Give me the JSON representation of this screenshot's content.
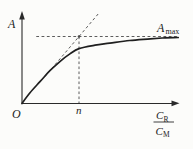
{
  "colors": {
    "background": "#fcfcfa",
    "ink": "#222222",
    "curve": "#1f1f1f",
    "dash": "#4a4a4a"
  },
  "labels": {
    "y_axis": "A",
    "origin": "O",
    "n_marker": "n",
    "amax_base": "A",
    "amax_sub": "max",
    "frac_num_base": "C",
    "frac_num_sub": "R",
    "frac_den_base": "C",
    "frac_den_sub": "M"
  },
  "chart_data": {
    "type": "line",
    "title": "",
    "xlabel": "C_R/C_M",
    "ylabel": "A",
    "x_units": "normalized, tangent-asymptote intersection at x = n = 1",
    "y_units": "normalized, asymptote A_max = 1",
    "xlim": [
      0,
      2.9
    ],
    "ylim": [
      0,
      1.45
    ],
    "grid": false,
    "series": [
      {
        "name": "absorbance saturation curve",
        "x": [
          0,
          0.14,
          0.32,
          0.49,
          0.67,
          0.84,
          1.0,
          1.28,
          1.54,
          1.89,
          2.25,
          2.51,
          2.74
        ],
        "y": [
          0,
          0.16,
          0.33,
          0.49,
          0.63,
          0.74,
          0.82,
          0.87,
          0.9,
          0.94,
          0.965,
          0.98,
          0.985
        ]
      }
    ],
    "asymptote": {
      "label": "A_max",
      "y": 1,
      "dash_from_x": 0.25,
      "dash_to_x": 2.74
    },
    "tangent": {
      "slope": 1,
      "through": [
        0,
        0
      ],
      "visible_from_x": 0.4,
      "extends_to_x": 1.35
    },
    "vertical_guide": {
      "label": "n",
      "x": 1,
      "from_y": 0,
      "to_y": 1
    },
    "intersection_dot": {
      "x": 1,
      "y": 1
    },
    "annotations": [
      "dashed horizontal asymptote labeled A_max",
      "dashed initial-slope tangent through origin",
      "dashed vertical guide dropping to x-axis at n",
      "small dot where tangent meets asymptote"
    ]
  }
}
